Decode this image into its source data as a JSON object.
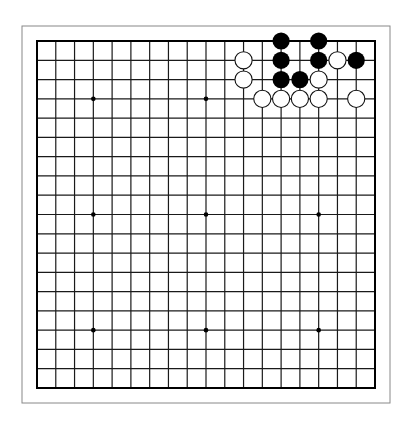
{
  "board": {
    "size": 19,
    "frame": {
      "left": 22,
      "top": 26,
      "right": 390,
      "bottom": 403,
      "color": "#888888"
    },
    "grid": {
      "left": 37,
      "top": 41,
      "right": 375,
      "bottom": 388,
      "line_color": "#1a1a1a",
      "edge_color": "#000000"
    },
    "star_points": [
      [
        3,
        3
      ],
      [
        9,
        3
      ],
      [
        15,
        3
      ],
      [
        3,
        9
      ],
      [
        9,
        9
      ],
      [
        15,
        9
      ],
      [
        3,
        15
      ],
      [
        9,
        15
      ],
      [
        15,
        15
      ]
    ],
    "stone_radius": 8.6,
    "colors": {
      "black": "#000000",
      "white": "#ffffff",
      "white_outline": "#111111"
    },
    "stones": [
      {
        "color": "black",
        "col": 13,
        "row": 0
      },
      {
        "color": "black",
        "col": 15,
        "row": 0
      },
      {
        "color": "white",
        "col": 11,
        "row": 1
      },
      {
        "color": "black",
        "col": 13,
        "row": 1
      },
      {
        "color": "black",
        "col": 15,
        "row": 1
      },
      {
        "color": "white",
        "col": 16,
        "row": 1
      },
      {
        "color": "black",
        "col": 17,
        "row": 1
      },
      {
        "color": "white",
        "col": 11,
        "row": 2
      },
      {
        "color": "black",
        "col": 13,
        "row": 2
      },
      {
        "color": "black",
        "col": 14,
        "row": 2
      },
      {
        "color": "white",
        "col": 15,
        "row": 2
      },
      {
        "color": "white",
        "col": 12,
        "row": 3
      },
      {
        "color": "white",
        "col": 13,
        "row": 3
      },
      {
        "color": "white",
        "col": 14,
        "row": 3
      },
      {
        "color": "white",
        "col": 15,
        "row": 3
      },
      {
        "color": "white",
        "col": 17,
        "row": 3
      }
    ]
  }
}
